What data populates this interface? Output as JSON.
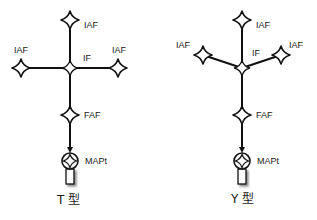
{
  "diagrams": [
    {
      "caption": "T 型",
      "labels": {
        "iaf_top": "IAF",
        "iaf_left": "IAF",
        "iaf_right": "IAF",
        "if": "IF",
        "faf": "FAF",
        "mapt": "MAPt"
      }
    },
    {
      "caption": "Y 型",
      "labels": {
        "iaf_top": "IAF",
        "iaf_left": "IAF",
        "iaf_right": "IAF",
        "if": "IF",
        "faf": "FAF",
        "mapt": "MAPt"
      }
    }
  ],
  "colors": {
    "line": "#111111",
    "background": "#ffffff"
  }
}
